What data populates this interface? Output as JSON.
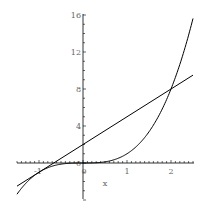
{
  "chart_data": {
    "type": "line",
    "title": "",
    "xlabel": "x",
    "ylabel": "",
    "xlim": [
      -1.5,
      2.5
    ],
    "ylim": [
      -4,
      16
    ],
    "grid": false,
    "legend": null,
    "x_ticks": [
      "-1",
      "0",
      "1",
      "2"
    ],
    "y_ticks": [
      "4",
      "8",
      "12",
      "16"
    ],
    "series": [
      {
        "name": "x^3",
        "expression": "y = x^3",
        "x": [
          -1.5,
          -1,
          -0.5,
          0,
          0.5,
          1,
          1.5,
          2,
          2.5
        ],
        "values": [
          -3.375,
          -1,
          -0.125,
          0,
          0.125,
          1,
          3.375,
          8,
          15.625
        ]
      },
      {
        "name": "3x+2",
        "expression": "y = 3x + 2",
        "x": [
          -1.5,
          -1,
          -0.5,
          0,
          0.5,
          1,
          1.5,
          2,
          2.5
        ],
        "values": [
          -2.5,
          -1,
          0.5,
          2,
          3.5,
          5,
          6.5,
          8,
          9.5
        ]
      }
    ],
    "annotations": [
      "curves touch at x = -1",
      "curves intersect at (2, 8)"
    ]
  },
  "labels": {
    "x_axis": "x",
    "x_tick_neg1": "-1",
    "x_tick_0": "0",
    "x_tick_1": "1",
    "x_tick_2": "2",
    "y_tick_4": "4",
    "y_tick_8": "8",
    "y_tick_12": "12",
    "y_tick_16": "16",
    "y_tick_0": "0"
  }
}
